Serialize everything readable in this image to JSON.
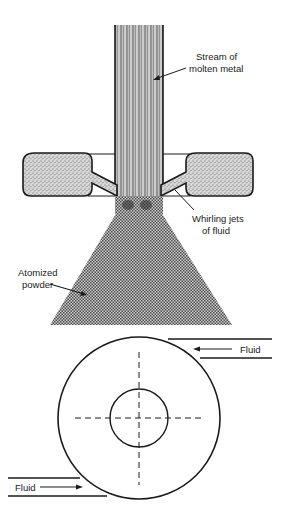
{
  "figure": {
    "type": "gas/fluid atomization schematic",
    "colors": {
      "ink": "#1a1a1a",
      "background": "#ffffff",
      "stream_fill": "#9a9a9a",
      "powder_fill": "#7a7a7a"
    }
  },
  "side_view": {
    "labels": {
      "stream": [
        "Stream of",
        "molten metal"
      ],
      "jets": [
        "Whirling jets",
        "of fluid"
      ],
      "powder": [
        "Atomized",
        "powder"
      ]
    }
  },
  "top_view": {
    "inlets": [
      {
        "label": "Fluid",
        "direction": "left",
        "position": "upper-right"
      },
      {
        "label": "Fluid",
        "direction": "right",
        "position": "lower-left"
      }
    ]
  }
}
